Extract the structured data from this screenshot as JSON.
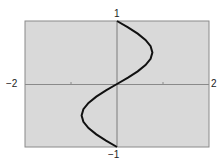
{
  "chart_data": {
    "type": "line",
    "title": "",
    "xlabel": "",
    "ylabel": "",
    "xlim": [
      -2,
      2
    ],
    "ylim": [
      -1,
      1
    ],
    "grid": false,
    "tick_labels": {
      "x_min": "−2",
      "x_max": "2",
      "y_max": "1",
      "y_min": "−1"
    },
    "x_ticks": [
      -1,
      1
    ],
    "series": [
      {
        "name": "curve",
        "description": "x = 0.77·sin(πy), y from −1 to 1",
        "x": [
          0,
          -0.24,
          -0.45,
          -0.62,
          -0.73,
          -0.77,
          -0.73,
          -0.62,
          -0.45,
          -0.24,
          0,
          0.24,
          0.45,
          0.62,
          0.73,
          0.77,
          0.73,
          0.62,
          0.45,
          0.24,
          0
        ],
        "y": [
          -1,
          -0.9,
          -0.8,
          -0.7,
          -0.6,
          -0.5,
          -0.4,
          -0.3,
          -0.2,
          -0.1,
          0,
          0.1,
          0.2,
          0.3,
          0.4,
          0.5,
          0.6,
          0.7,
          0.8,
          0.9,
          1
        ]
      }
    ],
    "colors": {
      "background": "#d9d9d9",
      "frame": "#888888",
      "axis": "#8a8a8a",
      "curve": "#111111"
    }
  }
}
